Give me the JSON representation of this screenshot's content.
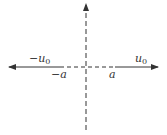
{
  "diagram": {
    "type": "axes",
    "colors": {
      "line": "#333333",
      "background": "#ffffff"
    },
    "labels": {
      "neg_u0": {
        "sign": "−",
        "base": "u",
        "sub": "0"
      },
      "pos_u0": {
        "base": "u",
        "sub": "0"
      },
      "neg_a": "−a",
      "pos_a": "a"
    },
    "segments": [
      {
        "name": "left-solid-arrow",
        "from": [
          60,
          67
        ],
        "to": [
          9,
          67
        ],
        "style": "solid",
        "arrow": true
      },
      {
        "name": "center-dashed",
        "from": [
          60,
          67
        ],
        "to": [
          115,
          67
        ],
        "style": "dashed"
      },
      {
        "name": "right-solid-arrow",
        "from": [
          115,
          67
        ],
        "to": [
          158,
          67
        ],
        "style": "solid",
        "arrow": true
      },
      {
        "name": "vertical-dashed-axis",
        "from": [
          86,
          130
        ],
        "to": [
          86,
          3
        ],
        "style": "dashed",
        "arrow": true
      }
    ]
  }
}
